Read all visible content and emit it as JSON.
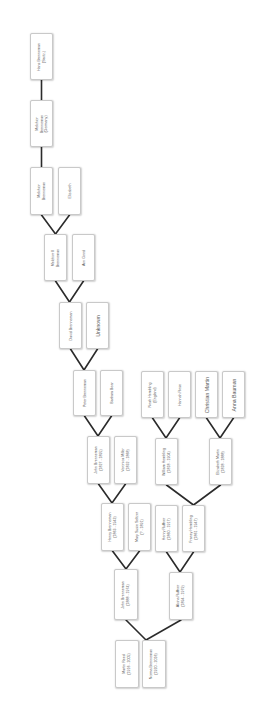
{
  "diagram": {
    "type": "family-tree",
    "orientation": "rotated-90-ccw",
    "line_color": "#2b2b2b",
    "box_border_color": "#c9c9c9",
    "text_color": "#555555"
  },
  "people": [
    {
      "id": "hans",
      "line1": "Hans Brenneman",
      "line2": "(Switz.)",
      "x": 30,
      "y": 33,
      "w": 23,
      "h": 47
    },
    {
      "id": "melchior-germany",
      "line1": "Melchior",
      "line2": "Brenneman",
      "line3": "(Germany)",
      "x": 30,
      "y": 100,
      "w": 23,
      "h": 47
    },
    {
      "id": "melchior",
      "line1": "Melchior",
      "line2": "Brenneman",
      "x": 30,
      "y": 167,
      "w": 23,
      "h": 48
    },
    {
      "id": "elizabeth",
      "line1": "Elizabeth",
      "x": 58,
      "y": 167,
      "w": 23,
      "h": 48
    },
    {
      "id": "melchior-ii",
      "line1": "Melchior II",
      "line2": "Brenneman",
      "x": 44,
      "y": 234,
      "w": 23,
      "h": 47
    },
    {
      "id": "ann-good",
      "line1": "Ann Good",
      "x": 72,
      "y": 234,
      "w": 23,
      "h": 47
    },
    {
      "id": "david",
      "line1": "David Brenneman",
      "x": 59,
      "y": 302,
      "w": 23,
      "h": 47
    },
    {
      "id": "unknown",
      "line1": "Unknown",
      "x": 86,
      "y": 302,
      "w": 23,
      "h": 47,
      "big": true
    },
    {
      "id": "peter",
      "line1": "Peter Brenneman",
      "x": 73,
      "y": 370,
      "w": 23,
      "h": 46
    },
    {
      "id": "barbara",
      "line1": "Barbara Bear",
      "x": 100,
      "y": 370,
      "w": 23,
      "h": 46
    },
    {
      "id": "noah",
      "line1": "Noah Hembling",
      "line2": "(England)",
      "x": 141,
      "y": 371,
      "w": 23,
      "h": 47
    },
    {
      "id": "hannah",
      "line1": "Hannah Rose",
      "x": 168,
      "y": 371,
      "w": 23,
      "h": 47
    },
    {
      "id": "christian",
      "line1": "Christian Martin",
      "x": 195,
      "y": 371,
      "w": 23,
      "h": 47,
      "big": true
    },
    {
      "id": "anna",
      "line1": "Anna Bauman",
      "x": 222,
      "y": 371,
      "w": 23,
      "h": 47,
      "big": true
    },
    {
      "id": "john-1827",
      "line1": "John Brenneman",
      "line2": "(1827 - 1895)",
      "x": 87,
      "y": 436,
      "w": 23,
      "h": 48
    },
    {
      "id": "veronica",
      "line1": "Veronica Miller",
      "line2": "(1832 - 1868)",
      "x": 114,
      "y": 436,
      "w": 23,
      "h": 48
    },
    {
      "id": "william",
      "line1": "William Hembling",
      "line2": "(1818 - 1904)",
      "x": 155,
      "y": 438,
      "w": 23,
      "h": 47
    },
    {
      "id": "elizabeth-martin",
      "line1": "Elizabeth Martin",
      "line2": "(1828 - 1888)",
      "x": 209,
      "y": 438,
      "w": 23,
      "h": 47
    },
    {
      "id": "henry-b",
      "line1": "Henry Brenneman",
      "line2": "(1863 - 1943)",
      "x": 101,
      "y": 503,
      "w": 23,
      "h": 48
    },
    {
      "id": "mary-susie",
      "line1": "Mary Susie Seltzer",
      "line2": "(? - 1891)",
      "x": 128,
      "y": 503,
      "w": 23,
      "h": 48
    },
    {
      "id": "henry-ruffner",
      "line1": "Henry Ruffner",
      "line2": "(1860 - 1917)",
      "x": 155,
      "y": 505,
      "w": 23,
      "h": 47
    },
    {
      "id": "franey",
      "line1": "Franey Hembling",
      "line2": "(1861 - 1947)",
      "x": 182,
      "y": 505,
      "w": 23,
      "h": 47
    },
    {
      "id": "john-1888",
      "line1": "John Brenneman",
      "line2": "(1888 - 1974)",
      "x": 114,
      "y": 569,
      "w": 24,
      "h": 51
    },
    {
      "id": "alcina",
      "line1": "Alcina Ruffner",
      "line2": "(1894 - 1979)",
      "x": 169,
      "y": 572,
      "w": 24,
      "h": 48
    },
    {
      "id": "martin-reed",
      "line1": "Martin Reed",
      "line2": "(1916 - 2005)",
      "x": 115,
      "y": 640,
      "w": 24,
      "h": 48
    },
    {
      "id": "norma",
      "line1": "Norma Brenneman",
      "line2": "(1920 - 2016)",
      "x": 142,
      "y": 640,
      "w": 24,
      "h": 48
    }
  ],
  "links": [
    {
      "type": "single",
      "from": "hans",
      "to": "melchior-germany"
    },
    {
      "type": "single",
      "from": "melchior-germany",
      "to": "melchior"
    },
    {
      "type": "couple",
      "a": "melchior",
      "b": "elizabeth",
      "child": "melchior-ii"
    },
    {
      "type": "couple",
      "a": "melchior-ii",
      "b": "ann-good",
      "child": "david"
    },
    {
      "type": "couple",
      "a": "david",
      "b": "unknown",
      "child": "peter"
    },
    {
      "type": "couple",
      "a": "peter",
      "b": "barbara",
      "child": "john-1827"
    },
    {
      "type": "couple",
      "a": "noah",
      "b": "hannah",
      "child": "william"
    },
    {
      "type": "couple",
      "a": "christian",
      "b": "anna",
      "child": "elizabeth-martin"
    },
    {
      "type": "couple",
      "a": "john-1827",
      "b": "veronica",
      "child": "henry-b"
    },
    {
      "type": "couple",
      "a": "william",
      "b": "elizabeth-martin",
      "child": "franey"
    },
    {
      "type": "couple",
      "a": "henry-b",
      "b": "mary-susie",
      "child": "john-1888"
    },
    {
      "type": "couple",
      "a": "henry-ruffner",
      "b": "franey",
      "child": "alcina"
    },
    {
      "type": "couple",
      "a": "john-1888",
      "b": "alcina",
      "child": "norma"
    }
  ]
}
